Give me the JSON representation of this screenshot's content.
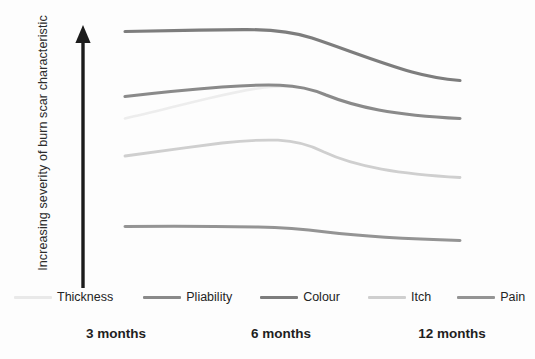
{
  "chart_data": {
    "type": "line",
    "title": "",
    "subtitle": "",
    "xlabel": "",
    "ylabel": "Increasing severity of burn scar characteristic",
    "categories": [
      "3 months",
      "6 months",
      "12 months"
    ],
    "x": [
      3,
      6,
      12
    ],
    "xlim": [
      3,
      12
    ],
    "ylim": [
      0,
      100
    ],
    "grid": false,
    "legend_position": "bottom",
    "y_axis_style": "arrow-only-no-ticks",
    "y_axis_has_tick_labels": false,
    "note": "Qualitative schematic: y-axis shows relative increasing severity with no numeric scale. Values below are estimated relative severity read off the plotted curve heights (0 = bottom of plot, 100 = top of plot).",
    "series": [
      {
        "name": "Thickness",
        "color": "#e9e9e9",
        "values": [
          66,
          76,
          61
        ],
        "note": "Very faint line; rises from 3 to 6 months then overlaps the Pliability curve"
      },
      {
        "name": "Pliability",
        "color": "#8a8a8a",
        "values": [
          74,
          79,
          61
        ],
        "note": "Rises slightly to a 6 month peak then declines"
      },
      {
        "name": "Colour",
        "color": "#7d7d7d",
        "values": [
          95,
          96,
          78
        ],
        "note": "Highest curve; flat to 6 months then steady decline to 12 months"
      },
      {
        "name": "Itch",
        "color": "#cfcfcf",
        "values": [
          57,
          62,
          48
        ],
        "note": "Light grey curve; gentle peak at 6 months then decline"
      },
      {
        "name": "Pain",
        "color": "#949494",
        "values": [
          35,
          35,
          30
        ],
        "note": "Lowest curve; nearly flat with slight decline after 6 months"
      }
    ],
    "legend": [
      {
        "label": "Thickness",
        "color": "#e9e9e9"
      },
      {
        "label": "Pliability",
        "color": "#8a8a8a"
      },
      {
        "label": "Colour",
        "color": "#7d7d7d"
      },
      {
        "label": "Itch",
        "color": "#cfcfcf"
      },
      {
        "label": "Pain",
        "color": "#949494"
      }
    ],
    "tick_labels": [
      "3 months",
      "6 months",
      "12 months"
    ]
  },
  "axis": {
    "y_label_text": "Increasing severity of burn scar characteristic",
    "arrow_direction": "up"
  },
  "ticks": [
    {
      "label": "3 months",
      "x_px": 116
    },
    {
      "label": "6 months",
      "x_px": 281
    },
    {
      "label": "12 months",
      "x_px": 452
    }
  ],
  "curves": [
    {
      "name": "Colour",
      "color": "#7d7d7d",
      "width": 3.1,
      "path": "M 125,31.5 C 160,30.6 205,30.0 244,29.6 C 272,29.4 292,31.5 312,38 C 345,49 380,63 412,72 C 430,77 448,79.5 460,80.5"
    },
    {
      "name": "Thickness",
      "color": "#ededed",
      "width": 2.6,
      "path": "M 125,118.5 C 150,113 180,105 210,98 C 232,93 248,89.5 264,87.5 C 276,86.3 288,86.0 300,87.5"
    },
    {
      "name": "Pliability",
      "color": "#8a8a8a",
      "width": 3.1,
      "path": "M 125,96.5 C 155,93 190,89.5 222,87 C 244,85.3 262,84.7 280,85.2 C 298,85.8 312,89 326,95 C 356,107 392,115 460,118.5"
    },
    {
      "name": "Itch",
      "color": "#cfcfcf",
      "width": 2.8,
      "path": "M 125,156 C 155,152 190,147 222,143 C 244,140.5 262,139.6 278,140.2 C 296,141 310,145 324,152 C 356,167 400,174 460,177.5"
    },
    {
      "name": "Pain",
      "color": "#949494",
      "width": 3.0,
      "path": "M 125,226.5 C 165,226.0 215,226.2 258,227.0 C 288,227.6 306,229.5 326,232 C 360,236 410,239 460,240.5"
    }
  ]
}
